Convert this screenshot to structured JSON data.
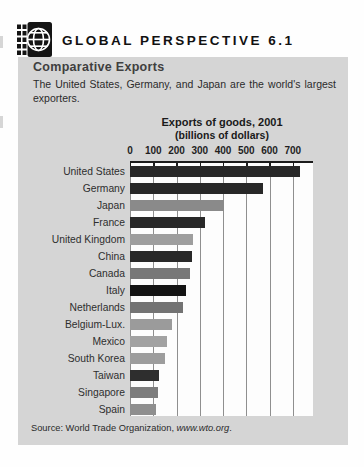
{
  "header": {
    "title": "GLOBAL PERSPECTIVE 6.1"
  },
  "panel": {
    "heading": "Comparative Exports",
    "body_line1": "The United States, Germany, and Japan are the world's largest",
    "body_line2": "exporters.",
    "source_prefix": "Source: World Trade Organization, ",
    "source_link": "www.wto.org",
    "source_suffix": "."
  },
  "chart": {
    "title_line1": "Exports of goods, 2001",
    "title_line2": "(billions of dollars)"
  },
  "chart_data": {
    "type": "bar",
    "orientation": "horizontal",
    "title": "Exports of goods, 2001 (billions of dollars)",
    "xlabel": "billions of dollars",
    "categories": [
      "United States",
      "Germany",
      "Japan",
      "France",
      "United Kingdom",
      "China",
      "Canada",
      "Italy",
      "Netherlands",
      "Belgium-Lux.",
      "Mexico",
      "South Korea",
      "Taiwan",
      "Singapore",
      "Spain"
    ],
    "values": [
      729,
      570,
      403,
      322,
      273,
      266,
      260,
      241,
      230,
      180,
      158,
      150,
      123,
      122,
      110
    ],
    "bar_colors": [
      "#282828",
      "#282828",
      "#8a8a8a",
      "#282828",
      "#9e9e9e",
      "#282828",
      "#787878",
      "#141414",
      "#737373",
      "#9b9b9b",
      "#a2a2a2",
      "#9d9d9d",
      "#2e2e2e",
      "#7d7d7d",
      "#8f8f8f"
    ],
    "xticks": [
      0,
      100,
      200,
      300,
      400,
      500,
      600,
      700
    ],
    "xlim": [
      0,
      787
    ],
    "grid": true,
    "legend": false,
    "source": "Source: World Trade Organization, www.wto.org."
  },
  "colors": {
    "panel_bg": "#d5d5d5",
    "plot_bg": "#fdfdfd",
    "gridline": "#8f8f8f",
    "axis": "#1c1c1c",
    "heading_text": "#3f3f3f",
    "body_text": "#2b2b2b"
  }
}
